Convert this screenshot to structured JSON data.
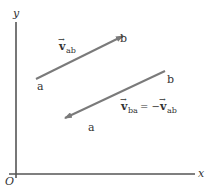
{
  "axes": {
    "x_label": "x",
    "y_label": "y",
    "origin_label": "O"
  },
  "vectors": [
    {
      "name": "v_ab",
      "symbol": "v",
      "subscript": "ab",
      "tail_label": "a",
      "head_label": "b",
      "color": "#7a7a7a"
    },
    {
      "name": "v_ba",
      "symbol": "v",
      "subscript": "ba",
      "equation_rhs_prefix": "= −",
      "equation_rhs_symbol": "v",
      "equation_rhs_subscript": "ab",
      "tail_label": "b",
      "head_label": "a",
      "color": "#7a7a7a"
    }
  ],
  "colors": {
    "axis": "#555555",
    "vector": "#7a7a7a",
    "text": "#333333"
  }
}
